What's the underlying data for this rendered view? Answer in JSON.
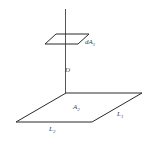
{
  "diagram": {
    "labels": {
      "small_area": "dA",
      "small_area_sub": "1",
      "distance": "D",
      "large_area": "A",
      "large_area_sub": "2",
      "side1": "L",
      "side1_sub": "1",
      "side2": "L",
      "side2_sub": "2"
    },
    "colors": {
      "line": "#2a2a2a",
      "label": "#444444",
      "background": "#ffffff"
    }
  }
}
